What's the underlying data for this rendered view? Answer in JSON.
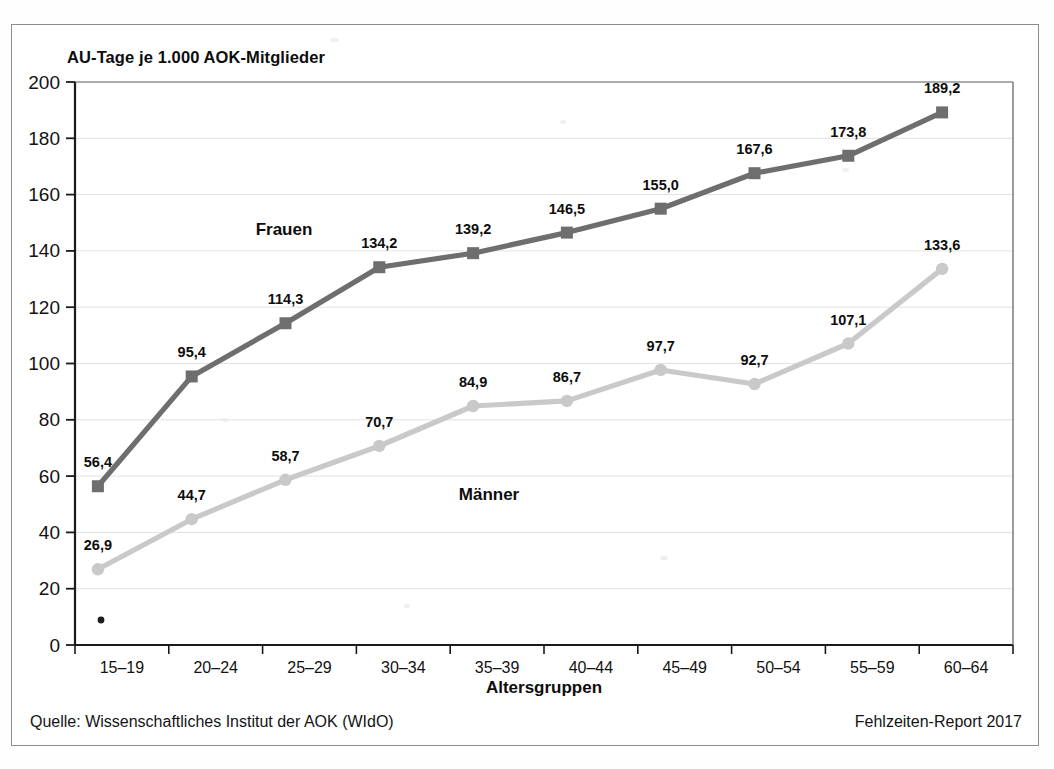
{
  "chart_data": {
    "type": "line",
    "title": "AU-Tage je 1.000 AOK-Mitglieder",
    "xlabel": "Altersgruppen",
    "ylabel": "",
    "ylim": [
      0,
      200
    ],
    "ytick_step": 20,
    "grid": true,
    "legend_position": "inline-annotations",
    "categories": [
      "15–19",
      "20–24",
      "25–29",
      "30–34",
      "35–39",
      "40–44",
      "45–49",
      "50–54",
      "55–59",
      "60–64"
    ],
    "yticks": [
      "0",
      "20",
      "40",
      "60",
      "80",
      "100",
      "120",
      "140",
      "160",
      "180",
      "200"
    ],
    "series": [
      {
        "name": "Frauen",
        "marker": "square",
        "color": "#6e6e6e",
        "values": [
          56.4,
          95.4,
          114.3,
          134.2,
          139.2,
          146.5,
          155.0,
          167.6,
          173.8,
          189.2
        ],
        "labels": [
          "56,4",
          "95,4",
          "114,3",
          "134,2",
          "139,2",
          "146,5",
          "155,0",
          "167,6",
          "173,8",
          "189,2"
        ]
      },
      {
        "name": "Männer",
        "marker": "circle",
        "color": "#c9c9c9",
        "values": [
          26.9,
          44.7,
          58.7,
          70.7,
          84.9,
          86.7,
          97.7,
          92.7,
          107.1,
          133.6
        ],
        "labels": [
          "26,9",
          "44,7",
          "58,7",
          "70,7",
          "84,9",
          "86,7",
          "97,7",
          "92,7",
          "107,1",
          "133,6"
        ]
      }
    ]
  },
  "annotations": {
    "frauen_label": "Frauen",
    "maenner_label": "Männer"
  },
  "footer": {
    "source": "Quelle: Wissenschaftliches Institut der AOK (WIdO)",
    "report": "Fehlzeiten-Report 2017"
  },
  "colors": {
    "frauen": "#6e6e6e",
    "maenner": "#c9c9c9",
    "axis": "#1a1a1a",
    "grid": "#e2e2e2",
    "frame": "#8c8c8c"
  }
}
